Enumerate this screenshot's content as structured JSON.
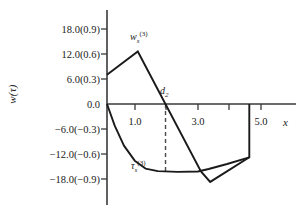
{
  "chart_data": {
    "type": "line",
    "title": "",
    "xlabel": "x",
    "ylabel": "w(τ)",
    "xlim": [
      0,
      5.6
    ],
    "ylim": [
      -24,
      21
    ],
    "grid": false,
    "legend_position": "inline-annotations",
    "x_ticks_labeled": [
      "1.0",
      "3.0",
      "5.0"
    ],
    "x_ticks_labeled_values": [
      1.0,
      3.0,
      5.0
    ],
    "x_ticks_minor_values": [
      2.0,
      4.0
    ],
    "y_ticks": [
      "18.0(0.9)",
      "12.0(0.6)",
      "6.0(0.3)",
      "0.0",
      "−6.0(−0.3)",
      "−12.0(−0.6)",
      "−18.0(−0.9)"
    ],
    "y_tick_values": [
      18.0,
      12.0,
      6.0,
      0.0,
      -6.0,
      -12.0,
      -18.0
    ],
    "y_tick_secondary_values": [
      0.9,
      0.6,
      0.3,
      0.0,
      -0.3,
      -0.6,
      -0.9
    ],
    "series": [
      {
        "name": "w_s^(3)",
        "label_text": "w",
        "label_sub": "s",
        "label_sup": "(3)",
        "style": "solid",
        "points": [
          [
            0.0,
            7.0
          ],
          [
            1.0,
            12.6
          ],
          [
            3.05,
            -16.2
          ],
          [
            3.35,
            -18.7
          ],
          [
            4.62,
            -12.8
          ],
          [
            4.62,
            0.0
          ]
        ]
      },
      {
        "name": "tau_s^(3)",
        "label_text": "τ",
        "label_sub": "s",
        "label_sup": "(3)",
        "style": "solid",
        "points": [
          [
            0.0,
            0.0
          ],
          [
            0.25,
            -5.2
          ],
          [
            0.55,
            -10.0
          ],
          [
            0.9,
            -13.6
          ],
          [
            1.25,
            -15.5
          ],
          [
            1.65,
            -16.1
          ],
          [
            2.3,
            -16.3
          ],
          [
            2.95,
            -16.2
          ],
          [
            3.3,
            -15.6
          ],
          [
            3.9,
            -14.4
          ],
          [
            4.62,
            -12.8
          ]
        ]
      }
    ],
    "annotations": [
      {
        "name": "d2",
        "text": "d",
        "sub": "2",
        "x": 1.9,
        "y": 2.8,
        "marker": "vertical-dashed-line",
        "line_from_y": 0.0,
        "line_to_y": -16.2
      }
    ],
    "colors": {
      "axis": "#3a3a3a",
      "curve": "#1a1a1a",
      "dashed": "#4a4a4a",
      "background": "#ffffff"
    }
  }
}
